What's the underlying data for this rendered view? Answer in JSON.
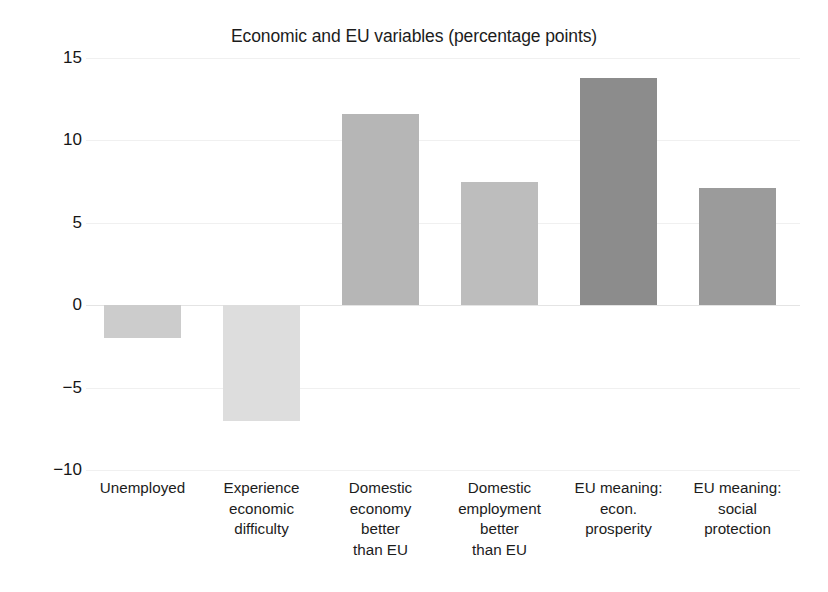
{
  "chart_data": {
    "type": "bar",
    "title": "Economic and EU variables (percentage points)",
    "xlabel": "",
    "ylabel": "",
    "ylim": [
      -10,
      15
    ],
    "yticks": [
      "15",
      "10",
      "5",
      "0",
      "−5",
      "−10"
    ],
    "ytick_values": [
      15,
      10,
      5,
      0,
      -5,
      -10
    ],
    "grid": true,
    "legend": "none",
    "categories": [
      "Unemployed",
      "Experience economic difficulty",
      "Domestic economy better than EU",
      "Domestic employment better than EU",
      "EU meaning: econ. prosperity",
      "EU meaning: social protection"
    ],
    "category_lines": [
      [
        "Unemployed"
      ],
      [
        "Experience",
        "economic",
        "difficulty"
      ],
      [
        "Domestic",
        "economy",
        "better",
        "than EU"
      ],
      [
        "Domestic",
        "employment",
        "better",
        "than EU"
      ],
      [
        "EU meaning:",
        "econ.",
        "prosperity"
      ],
      [
        "EU meaning:",
        "social",
        "protection"
      ]
    ],
    "values": [
      -2.0,
      -7.0,
      11.6,
      7.5,
      13.8,
      7.1
    ],
    "bar_colors": [
      "#cccccc",
      "#dddddd",
      "#b6b6b6",
      "#bdbdbd",
      "#8c8c8c",
      "#9b9b9b"
    ]
  }
}
